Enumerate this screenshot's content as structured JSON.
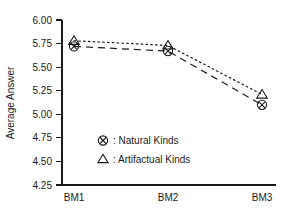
{
  "chart_data": {
    "type": "line",
    "title": "",
    "xlabel": "",
    "ylabel": "Average Answer",
    "categories": [
      "BM1",
      "BM2",
      "BM3"
    ],
    "ylim": [
      4.25,
      6.0
    ],
    "ytick_step": 0.25,
    "yticks": [
      "6.00",
      "5.75",
      "5.50",
      "5.25",
      "5.00",
      "4.75",
      "4.50",
      "4.25"
    ],
    "ytick_values": [
      6.0,
      5.75,
      5.5,
      5.25,
      5.0,
      4.75,
      4.5,
      4.25
    ],
    "grid": false,
    "legend_position": "inside-lower-left",
    "series": [
      {
        "name": "Natural Kinds",
        "legend_label": ": Natural Kinds",
        "marker": "circle-x",
        "linestyle": "dashed",
        "color": "#1a1a1a",
        "values": [
          5.72,
          5.67,
          5.1
        ]
      },
      {
        "name": "Artifactual Kinds",
        "legend_label": ": Artifactual Kinds",
        "marker": "triangle-up",
        "linestyle": "dotted",
        "color": "#1a1a1a",
        "values": [
          5.78,
          5.73,
          5.21
        ]
      }
    ]
  },
  "axis": {
    "y_title": "Average Answer"
  },
  "legend": {
    "entries": [
      {
        "symbol": "circle-x-marker",
        "text": ": Natural Kinds"
      },
      {
        "symbol": "triangle-marker",
        "text": ": Artifactual Kinds"
      }
    ]
  }
}
